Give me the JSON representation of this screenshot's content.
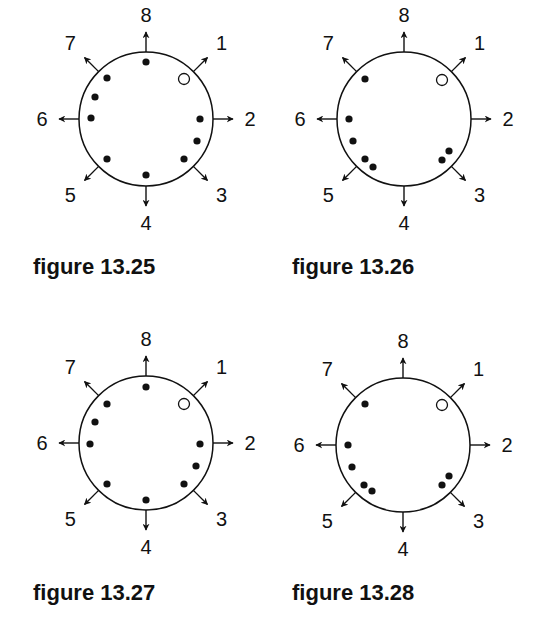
{
  "colors": {
    "ink": "#111111",
    "background": "#ffffff"
  },
  "direction_labels": [
    "1",
    "2",
    "3",
    "4",
    "5",
    "6",
    "7",
    "8"
  ],
  "figures": [
    {
      "caption": "figure 13.25",
      "center": [
        146,
        119
      ],
      "radius": 67,
      "caption_pos": [
        33,
        254
      ],
      "filled_dots": [
        [
          146,
          62
        ],
        [
          107,
          78
        ],
        [
          95,
          97
        ],
        [
          91,
          118
        ],
        [
          107,
          159
        ],
        [
          146,
          175
        ],
        [
          184,
          159
        ],
        [
          197,
          141
        ],
        [
          200,
          119
        ]
      ],
      "open_dots": [
        [
          184,
          79
        ]
      ]
    },
    {
      "caption": "figure 13.26",
      "center": [
        404,
        119
      ],
      "radius": 67,
      "caption_pos": [
        292,
        254
      ],
      "filled_dots": [
        [
          365,
          79
        ],
        [
          349,
          119
        ],
        [
          353,
          141
        ],
        [
          365,
          159
        ],
        [
          373,
          167
        ],
        [
          442,
          160
        ],
        [
          449,
          151
        ]
      ],
      "open_dots": [
        [
          442,
          80
        ]
      ]
    },
    {
      "caption": "figure 13.27",
      "center": [
        146,
        443
      ],
      "radius": 67,
      "caption_pos": [
        33,
        580
      ],
      "filled_dots": [
        [
          146,
          387
        ],
        [
          107,
          404
        ],
        [
          95,
          422
        ],
        [
          90,
          444
        ],
        [
          107,
          484
        ],
        [
          146,
          500
        ],
        [
          184,
          484
        ],
        [
          196,
          466
        ],
        [
          200,
          444
        ]
      ],
      "open_dots": [
        [
          184,
          404
        ]
      ]
    },
    {
      "caption": "figure 13.28",
      "center": [
        403,
        445
      ],
      "radius": 67,
      "caption_pos": [
        292,
        580
      ],
      "filled_dots": [
        [
          365,
          404
        ],
        [
          348,
          445
        ],
        [
          352,
          467
        ],
        [
          364,
          485
        ],
        [
          372,
          491
        ],
        [
          442,
          485
        ],
        [
          449,
          476
        ]
      ],
      "open_dots": [
        [
          442,
          405
        ]
      ]
    }
  ]
}
